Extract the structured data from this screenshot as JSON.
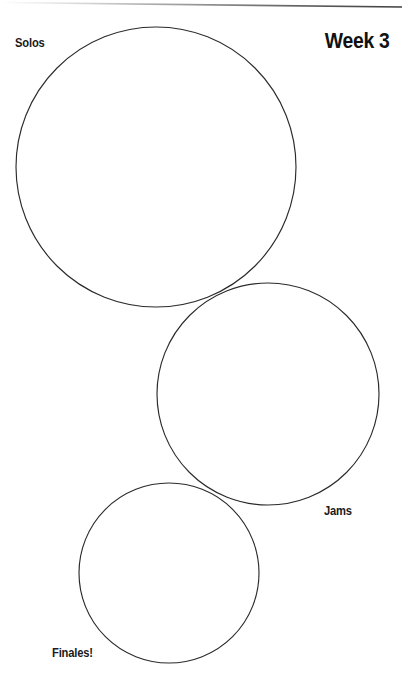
{
  "page": {
    "title": "Week 3",
    "background_color": "#ffffff",
    "width": 402,
    "height": 685
  },
  "header": {
    "week_title": "Week 3",
    "rule_color": "#6e6e6e"
  },
  "diagram": {
    "type": "venn-like-circle-chain",
    "stroke_color": "#2b2b2b",
    "fill": "none",
    "circles": [
      {
        "id": "solos",
        "label": "Solos",
        "cx": 156,
        "cy": 167,
        "r": 140,
        "label_x": 15,
        "label_y": 44
      },
      {
        "id": "jams",
        "label": "Jams",
        "cx": 268,
        "cy": 394,
        "r": 111,
        "label_x": 324,
        "label_y": 512
      },
      {
        "id": "finales",
        "label": "Finales!",
        "cx": 169,
        "cy": 573,
        "r": 90,
        "label_x": 52,
        "label_y": 654
      }
    ],
    "tangencies": [
      {
        "between": [
          "solos",
          "jams"
        ],
        "x": 222,
        "y": 301
      },
      {
        "between": [
          "jams",
          "finales"
        ],
        "x": 215,
        "y": 491
      }
    ]
  },
  "labels": {
    "solos": "Solos",
    "jams": "Jams",
    "finales": "Finales!"
  }
}
